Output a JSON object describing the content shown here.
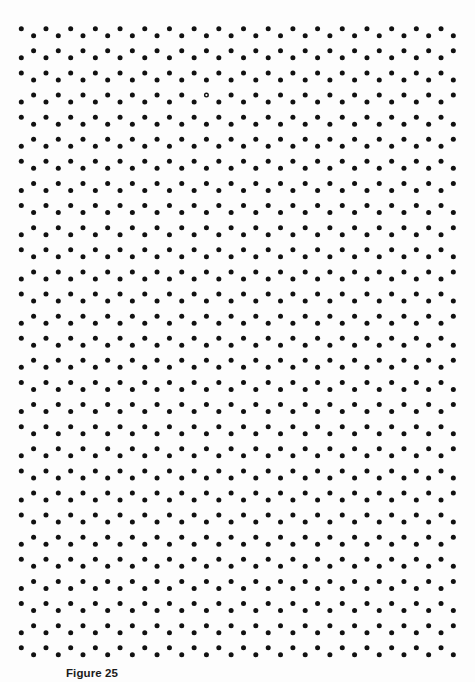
{
  "figure": {
    "caption": "Figure 25",
    "background_color": "#fdfdfd",
    "dot_color": "#111111",
    "pattern": {
      "description": "Regular dot lattice arranged in paired zigzag rows",
      "pairs": 29,
      "dots_per_row": 18,
      "first_row_y": 28.7,
      "pair_spacing_y": 22.11,
      "intra_pair_offset_y": 7.0,
      "row_a_start_x": 21.3,
      "row_b_start_x": 33.6,
      "column_spacing_x": 24.69,
      "dot_radius": 2.5,
      "pair_order_rule": "even pairs: A-row above B-row; odd pairs: B-row above A-row"
    },
    "anomalies": [
      {
        "type": "hollow-dot",
        "pair": 3,
        "row": "B",
        "column": 7,
        "approx_x": 206,
        "approx_y": 94
      }
    ]
  }
}
